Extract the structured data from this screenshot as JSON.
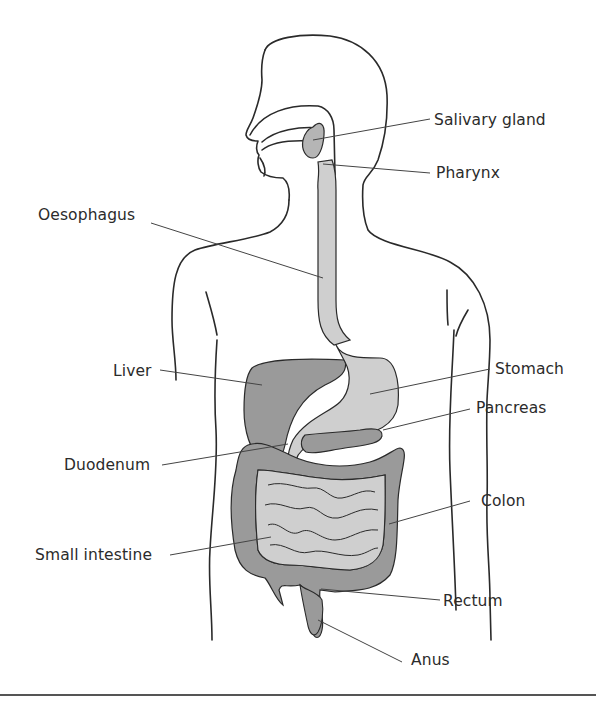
{
  "diagram": {
    "colors": {
      "outline": "#2a2a2a",
      "leader_line": "#444444",
      "organ_dark": "#9a9a9a",
      "organ_light": "#cfcfcf",
      "background": "#ffffff"
    },
    "labels": [
      {
        "id": "salivary-gland",
        "text": "Salivary gland",
        "side": "right"
      },
      {
        "id": "pharynx",
        "text": "Pharynx",
        "side": "right"
      },
      {
        "id": "oesophagus",
        "text": "Oesophagus",
        "side": "left"
      },
      {
        "id": "liver",
        "text": "Liver",
        "side": "left"
      },
      {
        "id": "stomach",
        "text": "Stomach",
        "side": "right"
      },
      {
        "id": "pancreas",
        "text": "Pancreas",
        "side": "right"
      },
      {
        "id": "duodenum",
        "text": "Duodenum",
        "side": "left"
      },
      {
        "id": "colon",
        "text": "Colon",
        "side": "right"
      },
      {
        "id": "small-intestine",
        "text": "Small intestine",
        "side": "left"
      },
      {
        "id": "rectum",
        "text": "Rectum",
        "side": "right"
      },
      {
        "id": "anus",
        "text": "Anus",
        "side": "right"
      }
    ]
  }
}
